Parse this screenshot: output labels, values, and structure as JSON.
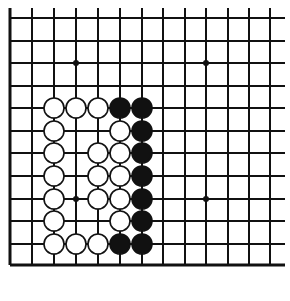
{
  "board": {
    "columns_x": [
      10,
      32,
      54,
      76,
      98,
      120,
      142,
      163,
      185,
      206,
      228,
      249,
      270
    ],
    "rows_y": [
      18,
      41,
      63,
      86,
      108,
      131,
      153,
      176,
      199,
      221,
      244,
      265
    ],
    "left_edge": true,
    "bottom_edge": true,
    "top_open": true,
    "right_open": true,
    "line_color": "#111111",
    "edge_width": 3,
    "line_width": 2,
    "stone_radius": 10
  },
  "hoshi": [
    {
      "col": 3,
      "row": 2
    },
    {
      "col": 9,
      "row": 2
    },
    {
      "col": 3,
      "row": 8
    },
    {
      "col": 9,
      "row": 8
    }
  ],
  "stones": [
    {
      "color": "white",
      "col": 2,
      "row": 4
    },
    {
      "color": "white",
      "col": 3,
      "row": 4
    },
    {
      "color": "white",
      "col": 4,
      "row": 4
    },
    {
      "color": "black",
      "col": 5,
      "row": 4
    },
    {
      "color": "black",
      "col": 6,
      "row": 4
    },
    {
      "color": "white",
      "col": 2,
      "row": 5
    },
    {
      "color": "white",
      "col": 5,
      "row": 5
    },
    {
      "color": "black",
      "col": 6,
      "row": 5
    },
    {
      "color": "white",
      "col": 2,
      "row": 6
    },
    {
      "color": "white",
      "col": 4,
      "row": 6
    },
    {
      "color": "white",
      "col": 5,
      "row": 6
    },
    {
      "color": "black",
      "col": 6,
      "row": 6
    },
    {
      "color": "white",
      "col": 2,
      "row": 7
    },
    {
      "color": "white",
      "col": 4,
      "row": 7
    },
    {
      "color": "white",
      "col": 5,
      "row": 7
    },
    {
      "color": "black",
      "col": 6,
      "row": 7
    },
    {
      "color": "white",
      "col": 2,
      "row": 8
    },
    {
      "color": "white",
      "col": 4,
      "row": 8
    },
    {
      "color": "white",
      "col": 5,
      "row": 8
    },
    {
      "color": "black",
      "col": 6,
      "row": 8
    },
    {
      "color": "white",
      "col": 2,
      "row": 9
    },
    {
      "color": "white",
      "col": 5,
      "row": 9
    },
    {
      "color": "black",
      "col": 6,
      "row": 9
    },
    {
      "color": "white",
      "col": 2,
      "row": 10
    },
    {
      "color": "white",
      "col": 3,
      "row": 10
    },
    {
      "color": "white",
      "col": 4,
      "row": 10
    },
    {
      "color": "black",
      "col": 5,
      "row": 10
    },
    {
      "color": "black",
      "col": 6,
      "row": 10
    }
  ]
}
